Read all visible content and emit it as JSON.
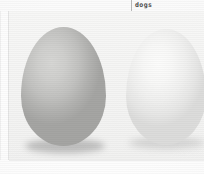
{
  "document": {
    "caption": {
      "text": "dogs",
      "divider_icon": "vertical-rule-icon"
    },
    "figure": {
      "alt": "two eggs photograph",
      "subjects": [
        {
          "name": "left-egg",
          "shade_label": "brown",
          "color": "#c2c2c0",
          "shadow_color": "#787878"
        },
        {
          "name": "right-egg",
          "shade_label": "white",
          "color": "#f0f0ef",
          "shadow_color": "#969696"
        }
      ],
      "background_color": "#f4f4f3",
      "page_margin_color": "#fdfdfd"
    }
  }
}
